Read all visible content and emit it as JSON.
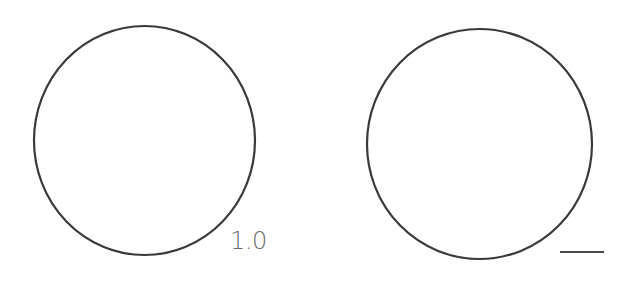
{
  "figure": {
    "panels": [
      {
        "name": "left-panel",
        "shape": "circle",
        "cx": 144.5,
        "cy": 140.5,
        "rx": 110.5,
        "ry": 114.5,
        "label": "1.0"
      },
      {
        "name": "right-panel",
        "shape": "circle",
        "cx": 479.5,
        "cy": 144,
        "rx": 112.5,
        "ry": 115,
        "scale_bar": true
      }
    ],
    "colors": {
      "stroke": "#3a3a3a",
      "label": "#6a6a6a",
      "background": "#ffffff"
    }
  }
}
